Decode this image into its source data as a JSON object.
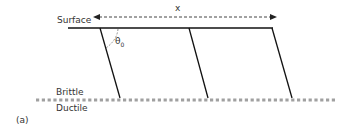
{
  "figure": {
    "panel_label": "(a)",
    "labels": {
      "surface": "Surface",
      "brittle": "Brittle",
      "ductile": "Ductile",
      "spacing": "x",
      "angle_symbol": "θ",
      "angle_subscript": "0"
    },
    "elements": {
      "surface_line": "solid horizontal line representing the ground surface",
      "spacing_arrow": "dashed double-headed arrow spanning fault spacing x",
      "faults": [
        "fault 1",
        "fault 2",
        "fault 3"
      ],
      "brittle_ductile_transition": "grey dashed horizontal line"
    },
    "colors": {
      "line": "#111111",
      "text": "#333333",
      "transition_dash": "#a0a0a0",
      "arrow_dash": "#444444"
    }
  }
}
